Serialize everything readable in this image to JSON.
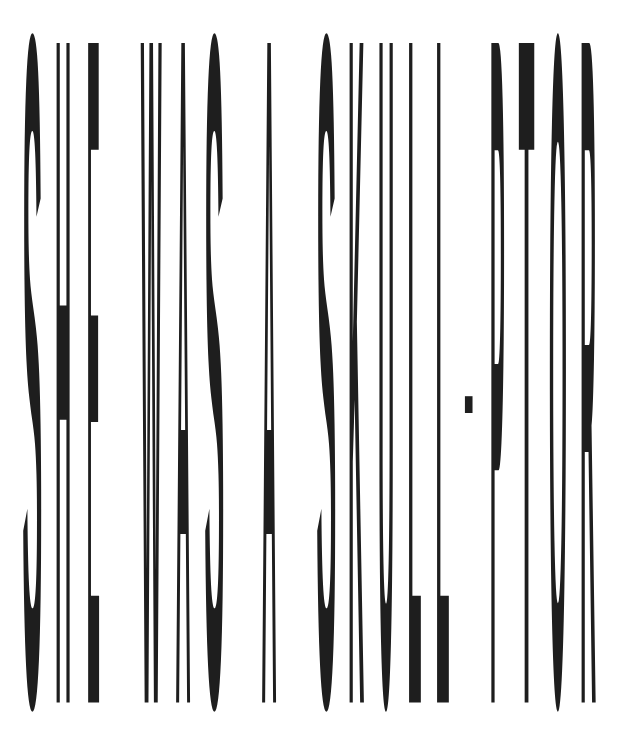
{
  "headline": {
    "text": "SHE WAS A SKULL-PTOR",
    "color": "#1e1e1e",
    "background": "#ffffff",
    "glyphs": [
      {
        "char": "S",
        "x": 22,
        "w": 20
      },
      {
        "char": "H",
        "x": 55,
        "w": 16
      },
      {
        "char": "E",
        "x": 87,
        "w": 13
      },
      {
        "char": "W",
        "x": 141,
        "w": 21
      },
      {
        "char": "A",
        "x": 176,
        "w": 15
      },
      {
        "char": "S",
        "x": 204,
        "w": 20
      },
      {
        "char": "A",
        "x": 262,
        "w": 15
      },
      {
        "char": "S",
        "x": 316,
        "w": 20
      },
      {
        "char": "K",
        "x": 348,
        "w": 16
      },
      {
        "char": "U",
        "x": 378,
        "w": 16
      },
      {
        "char": "L",
        "x": 408,
        "w": 14
      },
      {
        "char": "L",
        "x": 436,
        "w": 14
      },
      {
        "char": "-",
        "x": 464,
        "w": 10
      },
      {
        "char": "P",
        "x": 490,
        "w": 15
      },
      {
        "char": "T",
        "x": 519,
        "w": 16
      },
      {
        "char": "O",
        "x": 549,
        "w": 18
      },
      {
        "char": "R",
        "x": 580,
        "w": 16
      }
    ]
  }
}
